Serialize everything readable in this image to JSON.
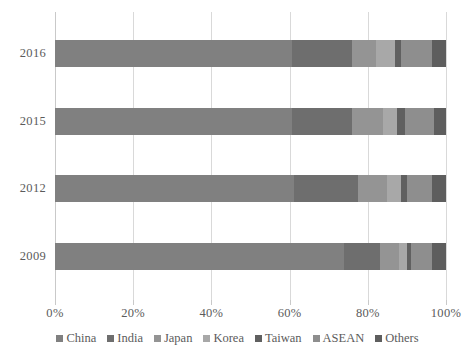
{
  "chart_data": {
    "type": "bar",
    "orientation": "horizontal",
    "stacked": true,
    "normalized_percent": true,
    "title": "",
    "subtitle": "",
    "xlabel": "",
    "ylabel": "",
    "xlim": [
      0,
      100
    ],
    "grid": true,
    "legend_position": "bottom",
    "categories": [
      "2016",
      "2015",
      "2012",
      "2009"
    ],
    "xticks": [
      "0%",
      "20%",
      "40%",
      "60%",
      "80%",
      "100%"
    ],
    "xtick_values": [
      0,
      20,
      40,
      60,
      80,
      100
    ],
    "series": [
      {
        "name": "China",
        "color": "#808080",
        "values": [
          60.5,
          60.5,
          61.0,
          74.0
        ]
      },
      {
        "name": "India",
        "color": "#6e6e6e",
        "values": [
          15.5,
          15.5,
          16.5,
          9.0
        ]
      },
      {
        "name": "Japan",
        "color": "#949494",
        "values": [
          6.0,
          8.0,
          7.5,
          5.0
        ]
      },
      {
        "name": "Korea",
        "color": "#a8a8a8",
        "values": [
          5.0,
          3.5,
          3.5,
          2.0
        ]
      },
      {
        "name": "Taiwan",
        "color": "#606060",
        "values": [
          1.5,
          2.0,
          1.5,
          1.0
        ]
      },
      {
        "name": "ASEAN",
        "color": "#8e8e8e",
        "values": [
          8.0,
          7.5,
          6.5,
          5.5
        ]
      },
      {
        "name": "Others",
        "color": "#5e5e5e",
        "values": [
          3.5,
          3.0,
          3.5,
          3.5
        ]
      }
    ]
  },
  "axis": {
    "tick_0": "0%",
    "tick_1": "20%",
    "tick_2": "40%",
    "tick_3": "60%",
    "tick_4": "80%",
    "tick_5": "100%"
  },
  "years": {
    "y0": "2016",
    "y1": "2015",
    "y2": "2012",
    "y3": "2009"
  },
  "legend": {
    "items": [
      {
        "label": "China"
      },
      {
        "label": "India"
      },
      {
        "label": "Japan"
      },
      {
        "label": "Korea"
      },
      {
        "label": "Taiwan"
      },
      {
        "label": "ASEAN"
      },
      {
        "label": "Others"
      }
    ]
  },
  "colors": {
    "grid": "#d9d9d9",
    "text": "#5b5b5b",
    "background": "#ffffff"
  }
}
